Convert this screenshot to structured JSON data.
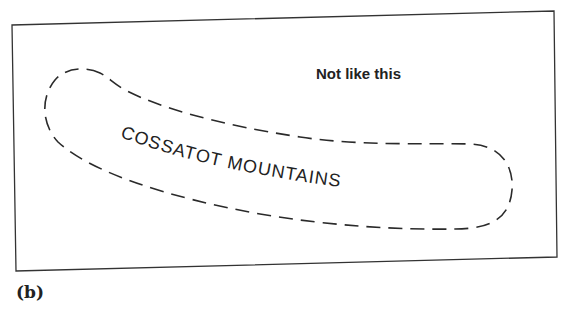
{
  "figure": {
    "annotation": "Not like this",
    "label": "COSSATOT MOUNTAINS",
    "caption": "(b)",
    "colors": {
      "ink": "#2a2a2a",
      "background": "#ffffff"
    }
  }
}
